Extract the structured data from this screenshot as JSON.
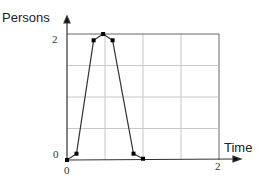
{
  "chart_data": {
    "type": "line",
    "title": "",
    "xlabel": "Time",
    "ylabel": "Persons",
    "xlim": [
      0,
      2
    ],
    "ylim": [
      0,
      2
    ],
    "x_ticks": [
      "0",
      "2"
    ],
    "y_ticks": [
      "0",
      "2"
    ],
    "grid": true,
    "grid_divisions": {
      "x": 4,
      "y": 4
    },
    "legend": null,
    "series": [
      {
        "name": "Persons",
        "color": "#333333",
        "marker": "square",
        "points": [
          {
            "x": 0.0,
            "y": 0.0
          },
          {
            "x": 0.125,
            "y": 0.1
          },
          {
            "x": 0.35,
            "y": 1.9
          },
          {
            "x": 0.475,
            "y": 2.0
          },
          {
            "x": 0.6,
            "y": 1.9
          },
          {
            "x": 0.875,
            "y": 0.1
          },
          {
            "x": 1.0,
            "y": 0.02
          }
        ]
      }
    ]
  },
  "labels": {
    "ylabel": "Persons",
    "xlabel": "Time",
    "y_tick_top": "2",
    "y_tick_bottom": "0",
    "x_tick_left": "0",
    "x_tick_right": "2"
  }
}
